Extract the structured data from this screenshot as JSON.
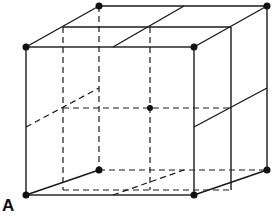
{
  "figure": {
    "type": "cube-lattice-diagram",
    "label": "A",
    "caption": "",
    "colors": {
      "line": "#1a1a1a",
      "point": "#111111",
      "background": "#ffffff"
    },
    "points": [
      {
        "name": "front-top-left",
        "x": 26,
        "y": 47
      },
      {
        "name": "front-top-right",
        "x": 194,
        "y": 47
      },
      {
        "name": "front-bottom-left",
        "x": 26,
        "y": 195
      },
      {
        "name": "front-bottom-right",
        "x": 194,
        "y": 195
      },
      {
        "name": "back-top-left",
        "x": 99,
        "y": 6
      },
      {
        "name": "back-top-right",
        "x": 267,
        "y": 6
      },
      {
        "name": "back-bottom-left",
        "x": 99,
        "y": 170
      },
      {
        "name": "back-bottom-right",
        "x": 267,
        "y": 170
      },
      {
        "name": "body-center",
        "x": 150,
        "y": 108
      }
    ]
  }
}
